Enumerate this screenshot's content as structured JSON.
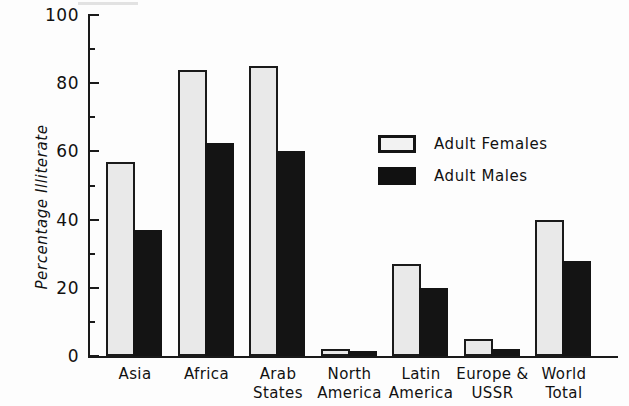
{
  "chart_data": {
    "type": "bar",
    "title": "",
    "xlabel": "",
    "ylabel": "Percentage Illiterate",
    "ylim": [
      0,
      100
    ],
    "grid": false,
    "legend_position": "inside-upper-right",
    "categories": [
      "Asia",
      "Africa",
      "Arab\nStates",
      "North\nAmerica",
      "Latin\nAmerica",
      "Europe &\nUSSR",
      "World\nTotal"
    ],
    "series": [
      {
        "name": "Adult Females",
        "color": "#e9e9e9",
        "values": [
          57,
          84,
          85,
          2,
          27,
          5,
          40
        ]
      },
      {
        "name": "Adult Males",
        "color": "#141414",
        "values": [
          37,
          62.5,
          60,
          1.5,
          20,
          2,
          28
        ]
      }
    ],
    "y_ticks_major": [
      0,
      20,
      40,
      60,
      80,
      100
    ],
    "y_ticks_major_labels": [
      "0",
      "20",
      "40",
      "60",
      "80",
      "100"
    ],
    "y_ticks_minor": [
      10,
      30,
      50,
      70,
      90
    ]
  },
  "legend": {
    "items": [
      {
        "label": "Adult Females",
        "swatch": "female-swatch"
      },
      {
        "label": "Adult Males",
        "swatch": "male-swatch"
      }
    ]
  }
}
